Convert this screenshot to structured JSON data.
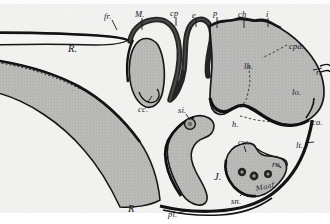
{
  "figure": {
    "kind": "anatomical-sagittal-section",
    "caption_text": "",
    "background_color": "#ffffff",
    "paper_tone": "#f2f2f0",
    "tissue_fill": "#b9b9b7",
    "outline_color": "#161616",
    "dashed_color": "#2b2b2b",
    "signature": "Maaf"
  },
  "labels": [
    {
      "id": "fr",
      "text": "fr.",
      "x": 104,
      "y": 12,
      "size": "normal"
    },
    {
      "id": "M",
      "text": "M.",
      "x": 135,
      "y": 10,
      "size": "normal"
    },
    {
      "id": "cp",
      "text": "cp",
      "x": 170,
      "y": 9,
      "size": "normal"
    },
    {
      "id": "e",
      "text": "e",
      "x": 192,
      "y": 11,
      "size": "normal"
    },
    {
      "id": "p",
      "text": "p",
      "x": 213,
      "y": 9,
      "size": "normal"
    },
    {
      "id": "ch",
      "text": "ch",
      "x": 238,
      "y": 10,
      "size": "normal"
    },
    {
      "id": "i",
      "text": "i",
      "x": 266,
      "y": 10,
      "size": "normal"
    },
    {
      "id": "cpa",
      "text": "cpa.",
      "x": 289,
      "y": 42,
      "size": "normal"
    },
    {
      "id": "r",
      "text": "r.",
      "x": 316,
      "y": 68,
      "size": "normal"
    },
    {
      "id": "lh",
      "text": "lh.",
      "x": 244,
      "y": 62,
      "size": "normal"
    },
    {
      "id": "lo",
      "text": "lo.",
      "x": 292,
      "y": 88,
      "size": "normal"
    },
    {
      "id": "ca",
      "text": "ca.",
      "x": 312,
      "y": 118,
      "size": "normal"
    },
    {
      "id": "lt",
      "text": "lt.",
      "x": 296,
      "y": 141,
      "size": "normal"
    },
    {
      "id": "h",
      "text": "h.",
      "x": 232,
      "y": 120,
      "size": "normal"
    },
    {
      "id": "Rtop",
      "text": "R.",
      "x": 68,
      "y": 44,
      "size": "big"
    },
    {
      "id": "cc",
      "text": "cc.",
      "x": 138,
      "y": 105,
      "size": "normal"
    },
    {
      "id": "si",
      "text": "si.",
      "x": 178,
      "y": 106,
      "size": "normal"
    },
    {
      "id": "cw",
      "text": "cw.",
      "x": 238,
      "y": 138,
      "size": "normal"
    },
    {
      "id": "ro",
      "text": "ro.",
      "x": 272,
      "y": 160,
      "size": "normal"
    },
    {
      "id": "J",
      "text": "J.",
      "x": 214,
      "y": 172,
      "size": "big"
    },
    {
      "id": "sn",
      "text": "sn.",
      "x": 231,
      "y": 197,
      "size": "normal"
    },
    {
      "id": "Rbot",
      "text": "R",
      "x": 128,
      "y": 204,
      "size": "big"
    },
    {
      "id": "pl",
      "text": "pl.",
      "x": 168,
      "y": 210,
      "size": "normal"
    }
  ],
  "legend_keys": [
    {
      "abbr": "fr.",
      "meaning": "fr."
    },
    {
      "abbr": "M.",
      "meaning": "M."
    },
    {
      "abbr": "cp",
      "meaning": "cp"
    },
    {
      "abbr": "e",
      "meaning": "e"
    },
    {
      "abbr": "p",
      "meaning": "p"
    },
    {
      "abbr": "ch",
      "meaning": "ch"
    },
    {
      "abbr": "i",
      "meaning": "i"
    },
    {
      "abbr": "cpa.",
      "meaning": "cpa."
    },
    {
      "abbr": "r.",
      "meaning": "r."
    },
    {
      "abbr": "lh.",
      "meaning": "lh."
    },
    {
      "abbr": "lo.",
      "meaning": "lo."
    },
    {
      "abbr": "ca.",
      "meaning": "ca."
    },
    {
      "abbr": "lt.",
      "meaning": "lt."
    },
    {
      "abbr": "h.",
      "meaning": "h."
    },
    {
      "abbr": "R.",
      "meaning": "R."
    },
    {
      "abbr": "cc.",
      "meaning": "cc."
    },
    {
      "abbr": "si.",
      "meaning": "si."
    },
    {
      "abbr": "cw.",
      "meaning": "cw."
    },
    {
      "abbr": "ro.",
      "meaning": "ro."
    },
    {
      "abbr": "J.",
      "meaning": "J."
    },
    {
      "abbr": "sn.",
      "meaning": "sn."
    },
    {
      "abbr": "pl.",
      "meaning": "pl."
    }
  ]
}
